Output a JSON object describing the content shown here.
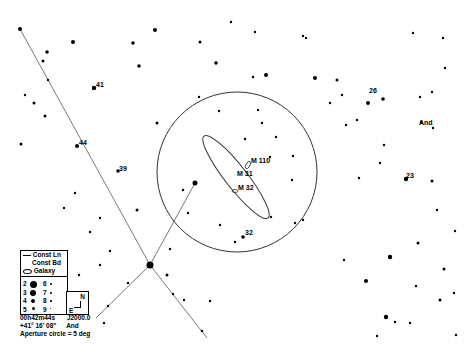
{
  "legend": {
    "lines": [
      {
        "label": "Const Ln",
        "icon": "line-icon"
      },
      {
        "label": "Const Bd",
        "icon": "none"
      },
      {
        "label": "Galaxy",
        "icon": "ellipse-icon"
      }
    ],
    "magnitudes": [
      {
        "mag": "2",
        "size": 5
      },
      {
        "mag": "3",
        "size": 4.2
      },
      {
        "mag": "4",
        "size": 3.2
      },
      {
        "mag": "5",
        "size": 2.4
      },
      {
        "mag": "6",
        "size": 1.8
      },
      {
        "mag": "7",
        "size": 1.4
      },
      {
        "mag": "8",
        "size": 1.1
      },
      {
        "mag": "9",
        "size": 0.8
      }
    ]
  },
  "compass": {
    "north": "N",
    "east": "E"
  },
  "footer": {
    "ra": "00h42m44s",
    "epoch": "J2000.0",
    "dec": "+41° 16' 08\"",
    "constellation": "And",
    "aperture": "Aperture circle = 5 deg"
  },
  "labels": {
    "m110": "M 110",
    "m31": "M 31",
    "m32": "M 32",
    "s41": "41",
    "s44": "44",
    "s39": "39",
    "s26": "26",
    "s23": "23",
    "s32": "32",
    "and": "And"
  },
  "colors": {
    "background": "#ffffff",
    "ink": "#000000",
    "line": "#555555"
  }
}
